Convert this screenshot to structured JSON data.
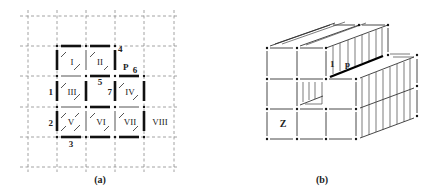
{
  "panel_a": {
    "caption": "(a)",
    "cells": [
      {
        "label": "I",
        "col": 0,
        "row": 0
      },
      {
        "label": "II",
        "col": 1,
        "row": 0
      },
      {
        "label": "III",
        "col": 0,
        "row": 1
      },
      {
        "label": "IV",
        "col": 2,
        "row": 1
      },
      {
        "label": "V",
        "col": 0,
        "row": 2
      },
      {
        "label": "VI",
        "col": 1,
        "row": 2
      },
      {
        "label": "VII",
        "col": 2,
        "row": 2
      },
      {
        "label": "VIII",
        "col": 3,
        "row": 2
      }
    ],
    "edge_labels": {
      "n1": "1",
      "n2": "2",
      "n3": "3",
      "n4": "4",
      "n5": "5",
      "n6": "6",
      "n7": "7",
      "p": "P"
    }
  },
  "panel_b": {
    "caption": "(b)",
    "labels": {
      "one": "1",
      "p": "p",
      "z": "Z"
    }
  }
}
